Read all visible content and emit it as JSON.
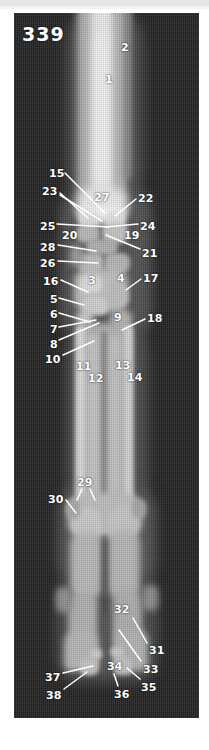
{
  "figure": {
    "number": "339"
  },
  "image": {
    "kind": "radiograph",
    "view": "dorsopalmar-distal-limb",
    "plate_color": "#242424",
    "label_color": "#ffffff",
    "leader_color": "#ffffff"
  },
  "labels": [
    {
      "id": "1",
      "text": "1",
      "x": 91,
      "y": 61,
      "leaders": []
    },
    {
      "id": "2",
      "text": "2",
      "x": 107,
      "y": 29,
      "leaders": []
    },
    {
      "id": "15",
      "text": "15",
      "x": 35,
      "y": 155,
      "leaders": [
        [
          51,
          160,
          91,
          200
        ]
      ]
    },
    {
      "id": "23",
      "text": "23",
      "x": 28,
      "y": 173,
      "leaders": [
        [
          46,
          180,
          74,
          205
        ],
        [
          46,
          182,
          88,
          208
        ]
      ]
    },
    {
      "id": "27",
      "text": "27",
      "x": 80,
      "y": 179,
      "leaders": []
    },
    {
      "id": "22",
      "text": "22",
      "x": 124,
      "y": 180,
      "leaders": [
        [
          122,
          186,
          101,
          203
        ]
      ]
    },
    {
      "id": "25",
      "text": "25",
      "x": 26,
      "y": 208,
      "leaders": [
        [
          43,
          211,
          95,
          214
        ]
      ]
    },
    {
      "id": "24",
      "text": "24",
      "x": 126,
      "y": 208,
      "leaders": [
        [
          124,
          211,
          92,
          214
        ]
      ]
    },
    {
      "id": "20",
      "text": "20",
      "x": 48,
      "y": 217,
      "leaders": []
    },
    {
      "id": "19",
      "text": "19",
      "x": 110,
      "y": 217,
      "leaders": []
    },
    {
      "id": "28",
      "text": "28",
      "x": 26,
      "y": 229,
      "leaders": [
        [
          44,
          232,
          82,
          238
        ]
      ]
    },
    {
      "id": "21",
      "text": "21",
      "x": 128,
      "y": 235,
      "leaders": [
        [
          126,
          236,
          92,
          222
        ]
      ]
    },
    {
      "id": "26",
      "text": "26",
      "x": 26,
      "y": 245,
      "leaders": [
        [
          44,
          248,
          84,
          250
        ]
      ]
    },
    {
      "id": "3",
      "text": "3",
      "x": 74,
      "y": 262,
      "leaders": []
    },
    {
      "id": "4",
      "text": "4",
      "x": 103,
      "y": 260,
      "leaders": []
    },
    {
      "id": "17",
      "text": "17",
      "x": 129,
      "y": 260,
      "leaders": [
        [
          127,
          266,
          112,
          277
        ]
      ]
    },
    {
      "id": "16",
      "text": "16",
      "x": 29,
      "y": 263,
      "leaders": [
        [
          47,
          267,
          74,
          279
        ]
      ]
    },
    {
      "id": "5",
      "text": "5",
      "x": 36,
      "y": 281,
      "leaders": [
        [
          45,
          285,
          70,
          292
        ]
      ]
    },
    {
      "id": "6",
      "text": "6",
      "x": 36,
      "y": 296,
      "leaders": [
        [
          45,
          300,
          76,
          309
        ]
      ]
    },
    {
      "id": "9",
      "text": "9",
      "x": 100,
      "y": 299,
      "leaders": []
    },
    {
      "id": "18",
      "text": "18",
      "x": 133,
      "y": 300,
      "leaders": [
        [
          131,
          306,
          108,
          317
        ]
      ]
    },
    {
      "id": "7",
      "text": "7",
      "x": 36,
      "y": 311,
      "leaders": [
        [
          45,
          314,
          82,
          307
        ]
      ]
    },
    {
      "id": "8",
      "text": "8",
      "x": 36,
      "y": 326,
      "leaders": [
        [
          45,
          327,
          85,
          310
        ]
      ]
    },
    {
      "id": "10",
      "text": "10",
      "x": 31,
      "y": 341,
      "leaders": [
        [
          49,
          342,
          80,
          328
        ]
      ]
    },
    {
      "id": "11",
      "text": "11",
      "x": 62,
      "y": 348,
      "leaders": []
    },
    {
      "id": "13",
      "text": "13",
      "x": 101,
      "y": 347,
      "leaders": []
    },
    {
      "id": "12",
      "text": "12",
      "x": 74,
      "y": 360,
      "leaders": []
    },
    {
      "id": "14",
      "text": "14",
      "x": 113,
      "y": 359,
      "leaders": []
    },
    {
      "id": "29",
      "text": "29",
      "x": 63,
      "y": 464,
      "leaders": [
        [
          68,
          476,
          63,
          487
        ],
        [
          76,
          476,
          81,
          487
        ]
      ]
    },
    {
      "id": "30",
      "text": "30",
      "x": 34,
      "y": 481,
      "leaders": [
        [
          52,
          487,
          62,
          500
        ]
      ]
    },
    {
      "id": "32",
      "text": "32",
      "x": 100,
      "y": 591,
      "leaders": []
    },
    {
      "id": "31",
      "text": "31",
      "x": 135,
      "y": 632,
      "leaders": [
        [
          133,
          630,
          119,
          605
        ]
      ]
    },
    {
      "id": "33",
      "text": "33",
      "x": 129,
      "y": 651,
      "leaders": [
        [
          127,
          648,
          105,
          617
        ]
      ]
    },
    {
      "id": "34",
      "text": "34",
      "x": 93,
      "y": 648,
      "leaders": []
    },
    {
      "id": "35",
      "text": "35",
      "x": 127,
      "y": 669,
      "leaders": [
        [
          126,
          666,
          113,
          655
        ]
      ]
    },
    {
      "id": "36",
      "text": "36",
      "x": 100,
      "y": 676,
      "leaders": [
        [
          104,
          673,
          100,
          661
        ]
      ]
    },
    {
      "id": "37",
      "text": "37",
      "x": 31,
      "y": 659,
      "leaders": [
        [
          49,
          660,
          79,
          653
        ]
      ]
    },
    {
      "id": "38",
      "text": "38",
      "x": 32,
      "y": 677,
      "leaders": [
        [
          50,
          676,
          73,
          659
        ]
      ]
    }
  ]
}
